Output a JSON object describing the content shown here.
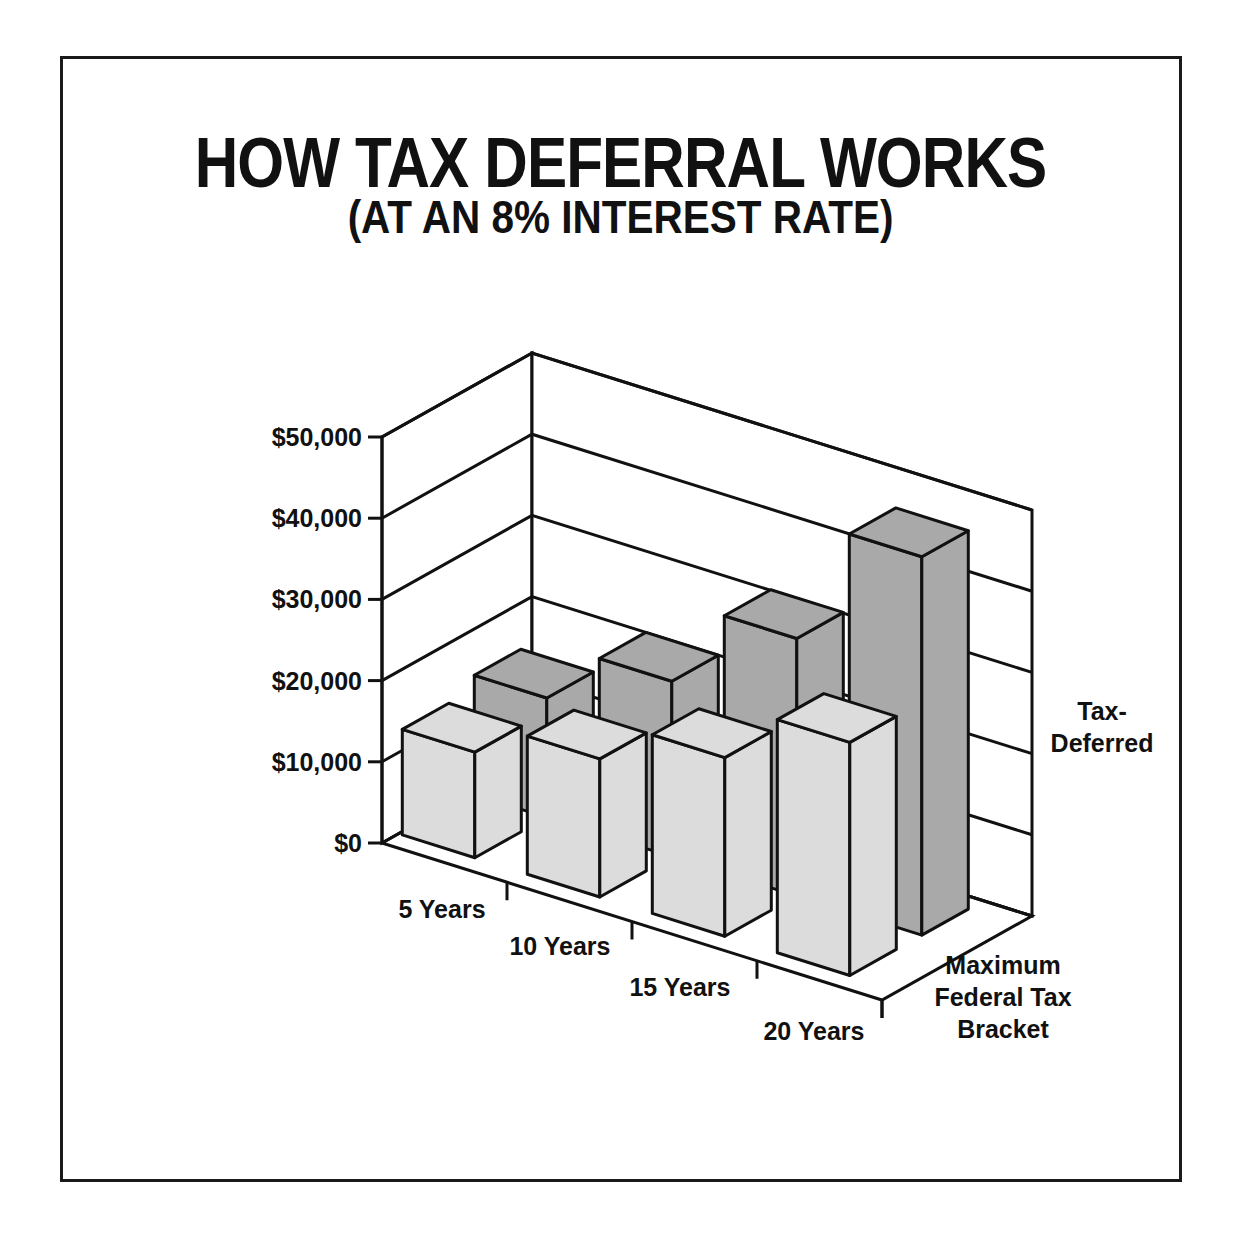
{
  "chart_data": {
    "type": "bar",
    "subtype": "3d-grouped-bar",
    "title": "HOW TAX DEFERRAL WORKS",
    "subtitle": "(AT AN 8% INTEREST RATE)",
    "xlabel": "",
    "ylabel": "",
    "categories": [
      "5 Years",
      "10 Years",
      "15 Years",
      "20 Years"
    ],
    "series": [
      {
        "name": "Maximum Federal Tax Bracket",
        "label_lines": [
          "Maximum",
          "Federal Tax",
          "Bracket"
        ],
        "color": "#dcdcdc",
        "values": [
          13000,
          17000,
          22000,
          28700
        ]
      },
      {
        "name": "Tax-Deferred",
        "label_lines": [
          "Tax-",
          "Deferred"
        ],
        "color": "#a9a9a9",
        "values": [
          14700,
          21600,
          31700,
          46600
        ]
      }
    ],
    "ylim": [
      0,
      50000
    ],
    "yticks": [
      0,
      10000,
      20000,
      30000,
      40000,
      50000
    ],
    "ytick_labels": [
      "$0",
      "$10,000",
      "$20,000",
      "$30,000",
      "$40,000",
      "$50,000"
    ],
    "grid": true,
    "legend": "series labels on right depth axis"
  }
}
